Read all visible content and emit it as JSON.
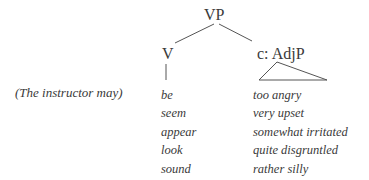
{
  "tree": {
    "root": "VP",
    "left_child": "V",
    "right_child": "c: AdjP",
    "line_color": "#555555"
  },
  "context_label": "(The instructor may)",
  "verbs": [
    "be",
    "seem",
    "appear",
    "look",
    "sound"
  ],
  "complements": [
    "too angry",
    "very upset",
    "somewhat irritated",
    "quite disgruntled",
    "rather silly"
  ]
}
